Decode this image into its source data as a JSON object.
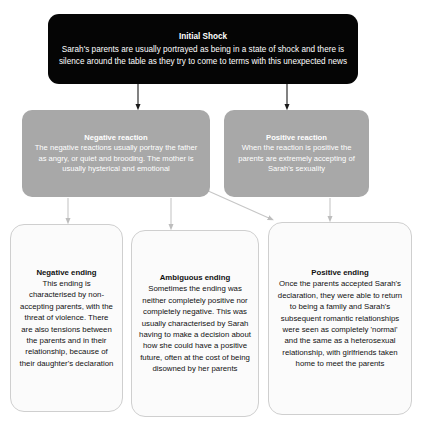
{
  "diagram": {
    "type": "flowchart",
    "orientation": "top-down",
    "tiers": 3,
    "nodes": [
      {
        "id": "initial-shock",
        "tier": 1,
        "style": "black-filled",
        "title": "Initial Shock",
        "body": "Sarah's parents are usually portrayed as being in a state of shock and there is silence around the table as they try to come to terms with this unexpected news"
      },
      {
        "id": "negative-reaction",
        "tier": 2,
        "style": "grey-filled",
        "title": "Negative reaction",
        "body": "The negative reactions usually portray the father as angry, or quiet and brooding. The mother is usually hysterical and emotional"
      },
      {
        "id": "positive-reaction",
        "tier": 2,
        "style": "grey-filled",
        "title": "Positive reaction",
        "body": "When the reaction is positive the parents are extremely accepting of Sarah's sexuality"
      },
      {
        "id": "negative-ending",
        "tier": 3,
        "style": "white-outlined",
        "title": "Negative ending",
        "body": "This ending is characterised by non-accepting parents, with the threat of violence. There are also tensions between the parents and in their relationship, because of their daughter's declaration"
      },
      {
        "id": "ambiguous-ending",
        "tier": 3,
        "style": "white-outlined",
        "title": "Ambiguous ending",
        "body": "Sometimes the ending was neither completely positive nor completely negative. This was usually characterised by Sarah having to make a decision about how she could have a positive future, often at the cost of being disowned by her parents"
      },
      {
        "id": "positive-ending",
        "tier": 3,
        "style": "white-outlined",
        "title": "Positive ending",
        "body": "Once the parents accepted Sarah's declaration, they were able to return to being a family and Sarah's subsequent romantic relationships were seen as completely 'normal' and the same as a heterosexual relationship, with girlfriends taken home to meet the parents"
      }
    ],
    "edges": [
      {
        "id": "edge-shock-to-negative",
        "from": "initial-shock",
        "to": "negative-reaction",
        "shape": "vertical-arrow"
      },
      {
        "id": "edge-shock-to-positive",
        "from": "initial-shock",
        "to": "positive-reaction",
        "shape": "vertical-arrow"
      },
      {
        "id": "edge-negative-to-negative-ending",
        "from": "negative-reaction",
        "to": "negative-ending",
        "shape": "vertical-arrow"
      },
      {
        "id": "edge-negative-to-ambiguous-ending",
        "from": "negative-reaction",
        "to": "ambiguous-ending",
        "shape": "vertical-arrow"
      },
      {
        "id": "edge-positive-to-positive-ending-diagonal",
        "from": "positive-reaction",
        "to": "positive-ending",
        "shape": "diagonal-arrow"
      },
      {
        "id": "edge-positive-to-positive-ending",
        "from": "positive-reaction",
        "to": "positive-ending",
        "shape": "vertical-arrow"
      }
    ]
  },
  "colors": {
    "root_fill": "#050505",
    "root_text": "#ffffff",
    "tier2_fill": "#a8a8a8",
    "tier2_text": "#ffffff",
    "tier3_fill": "#fbfbfb",
    "tier3_border": "#cfcfcf",
    "tier3_text": "#111111",
    "connector_dark": "#1a1a1a",
    "connector_light": "#c6c6c6",
    "background": "#ffffff"
  }
}
